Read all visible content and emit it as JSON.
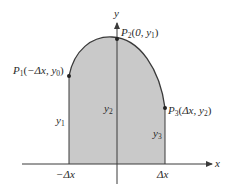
{
  "diagram": {
    "colors": {
      "fill": "#c9c9c9",
      "stroke": "#3a3a3a",
      "background": "#ffffff"
    },
    "axes": {
      "x_label": "x",
      "y_label": "y"
    },
    "points": [
      {
        "id": "P1",
        "name": "P",
        "sub": "1",
        "coords_open": "(",
        "coords_text": "−Δx, y",
        "coords_sub": "0",
        "coords_close": ")"
      },
      {
        "id": "P2",
        "name": "P",
        "sub": "2",
        "coords_open": "(",
        "coords_text": "0, y",
        "coords_sub": "1",
        "coords_close": ")"
      },
      {
        "id": "P3",
        "name": "P",
        "sub": "3",
        "coords_open": "(",
        "coords_text": "Δx, y",
        "coords_sub": "2",
        "coords_close": ")"
      }
    ],
    "heights": [
      {
        "name": "y",
        "sub": "1"
      },
      {
        "name": "y",
        "sub": "2"
      },
      {
        "name": "y",
        "sub": "3"
      }
    ],
    "ticks": [
      {
        "label": "−Δx"
      },
      {
        "label": "Δx"
      }
    ]
  }
}
